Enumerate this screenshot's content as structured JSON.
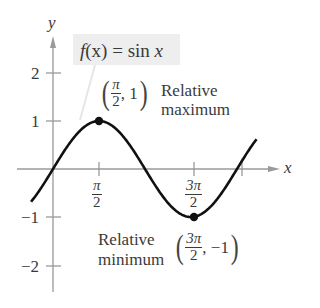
{
  "chart_data": {
    "type": "line",
    "title": "",
    "function_label": "f(x) = sin x",
    "xlabel": "x",
    "ylabel": "y",
    "x_ticks": [
      {
        "value": 1.5708,
        "label": "π/2",
        "num": "π",
        "den": "2"
      },
      {
        "value": 3.1416,
        "label": ""
      },
      {
        "value": 4.7124,
        "label": "3π/2",
        "num": "3π",
        "den": "2"
      },
      {
        "value": 6.2832,
        "label": ""
      }
    ],
    "y_ticks": [
      {
        "value": 2,
        "label": "2"
      },
      {
        "value": 1,
        "label": "1"
      },
      {
        "value": -1,
        "label": "−1"
      },
      {
        "value": -2,
        "label": "−2"
      }
    ],
    "xlim": [
      -0.8,
      7.0
    ],
    "ylim": [
      -2.5,
      2.7
    ],
    "grid": false,
    "series": [
      {
        "name": "sin x",
        "x_range": [
          -0.75,
          6.95
        ],
        "function": "sin"
      }
    ],
    "points": [
      {
        "x": 1.5708,
        "y": 1,
        "label": "(π/2, 1)",
        "annotation": [
          "Relative",
          "maximum"
        ]
      },
      {
        "x": 4.7124,
        "y": -1,
        "label": "(3π/2, −1)",
        "annotation": [
          "Relative",
          "minimum"
        ]
      }
    ],
    "colors": {
      "curve": "#111111",
      "axis": "#999999",
      "label_bg": "#eeeeee"
    }
  },
  "labels": {
    "y_axis": "y",
    "x_axis": "x",
    "func_f": "f",
    "func_rest": "(x) = sin ",
    "func_x": "x",
    "max_open": "(",
    "max_num": "π",
    "max_den": "2",
    "max_rest": ", 1",
    "max_close": ")",
    "max_line1": "Relative",
    "max_line2": "maximum",
    "min_line1": "Relative",
    "min_line2": "minimum",
    "min_open": "(",
    "min_num": "3π",
    "min_den": "2",
    "min_rest": ", −1",
    "min_close": ")",
    "tick_y2": "2",
    "tick_y1": "1",
    "tick_ym1": "−1",
    "tick_ym2": "−2",
    "tick_x1_num": "π",
    "tick_x1_den": "2",
    "tick_x3_num": "3π",
    "tick_x3_den": "2"
  }
}
